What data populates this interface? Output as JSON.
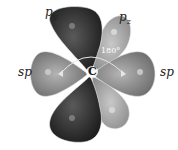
{
  "diagram": {
    "labels": {
      "py": {
        "base": "p",
        "sub": "y"
      },
      "pz": {
        "base": "p",
        "sub": "z"
      },
      "sp_left": "sp",
      "sp_right": "sp",
      "center": "C",
      "angle": "180°"
    },
    "colors": {
      "py_lobe": "#2e2e2e",
      "pz_lobe": "#a9a9a9",
      "sp_lobe": "#8a8a8a",
      "highlight": "#d0d0d0"
    }
  }
}
